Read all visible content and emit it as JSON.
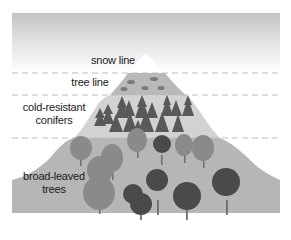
{
  "diagram": {
    "type": "altitudinal vegetation zones on a mountain",
    "zones": [
      {
        "id": "snow",
        "label": "snow line"
      },
      {
        "id": "treeline",
        "label": "tree line"
      },
      {
        "id": "conifers",
        "label_line1": "cold-resistant",
        "label_line2": "conifers"
      },
      {
        "id": "broadleaf",
        "label_line1": "broad-leaved",
        "label_line2": "trees"
      }
    ],
    "colors": {
      "sky_top": "#c4c4c4",
      "sky_bottom": "#ffffff",
      "snow": "#ffffff",
      "treeline_zone": "#b9b9b9",
      "conifer_zone": "#d2d2d2",
      "broadleaf_zone": "#b6b6b6",
      "dash": "#bdbdbd",
      "conifer_tree": "#595959",
      "broadleaf_light": "#8a8a8a",
      "broadleaf_dark": "#4a4a4a",
      "trunk": "#6e6e6e",
      "text": "#1a1a1a"
    }
  }
}
